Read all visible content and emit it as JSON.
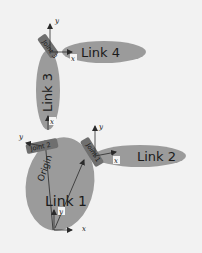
{
  "diagram": {
    "colors": {
      "background": "#f2f2f2",
      "link_fill": "#9b9b9b",
      "joint_fill": "#6f6f6f",
      "arrow": "#2a2a2a",
      "text": "#1a1a1a"
    },
    "links": [
      {
        "id": "link1",
        "label": "Link 1"
      },
      {
        "id": "link2",
        "label": "Link 2"
      },
      {
        "id": "link3",
        "label": "Link 3"
      },
      {
        "id": "link4",
        "label": "Link 4"
      }
    ],
    "joints": [
      {
        "id": "joint1",
        "label": "Joint 1"
      },
      {
        "id": "joint2",
        "label": "Joint 2"
      },
      {
        "id": "joint3",
        "label": "Joint 3"
      }
    ],
    "origin_label": "Origin",
    "axes": {
      "x": "x",
      "y": "y"
    }
  }
}
